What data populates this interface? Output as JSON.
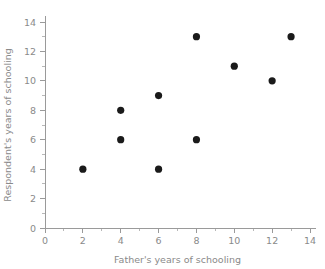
{
  "chart_data": {
    "type": "scatter",
    "title": "",
    "xlabel": "Father's years of schooling",
    "ylabel": "Respondent's years of schooling",
    "xlim": [
      0,
      14
    ],
    "ylim": [
      0,
      14
    ],
    "grid": false,
    "legend": null,
    "x_major_ticks": [
      0,
      2,
      4,
      6,
      8,
      10,
      12,
      14
    ],
    "y_major_ticks": [
      0,
      2,
      4,
      6,
      8,
      10,
      12,
      14
    ],
    "x_minor_ticks": [
      1,
      3,
      5,
      7,
      9,
      11,
      13
    ],
    "y_minor_ticks": [
      1,
      3,
      5,
      7,
      9,
      11,
      13
    ],
    "x_tick_labels": [
      "0",
      "2",
      "4",
      "6",
      "8",
      "10",
      "12",
      "14"
    ],
    "y_tick_labels": [
      "0",
      "2",
      "4",
      "6",
      "8",
      "10",
      "12",
      "14"
    ],
    "marker": "filled-circle",
    "marker_color": "#1a1a1a",
    "axis_color": "#9a9a9a",
    "text_color": "#8a8a8a",
    "points": [
      {
        "x": 2,
        "y": 4
      },
      {
        "x": 4,
        "y": 6
      },
      {
        "x": 4,
        "y": 8
      },
      {
        "x": 6,
        "y": 4
      },
      {
        "x": 6,
        "y": 9
      },
      {
        "x": 8,
        "y": 6
      },
      {
        "x": 8,
        "y": 13
      },
      {
        "x": 10,
        "y": 11
      },
      {
        "x": 12,
        "y": 10
      },
      {
        "x": 13,
        "y": 13
      }
    ],
    "x": [
      2,
      4,
      4,
      6,
      6,
      8,
      8,
      10,
      12,
      13
    ],
    "values": [
      4,
      6,
      8,
      4,
      9,
      6,
      13,
      11,
      10,
      13
    ]
  }
}
